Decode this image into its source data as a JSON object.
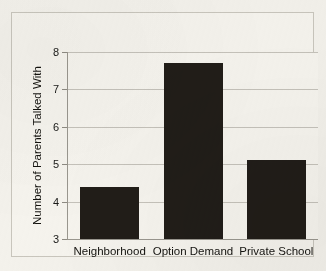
{
  "chart_data": {
    "type": "bar",
    "title": "",
    "xlabel": "",
    "ylabel": "Number of Parents Talked With",
    "categories": [
      "Neighborhood",
      "Option Demand",
      "Private School"
    ],
    "values": [
      4.4,
      7.7,
      5.1
    ],
    "ylim": [
      3,
      8
    ],
    "yticks": [
      3,
      4,
      5,
      6,
      7,
      8
    ],
    "ytick_labels": [
      "3",
      "4",
      "5",
      "6",
      "7",
      "8"
    ],
    "grid": true,
    "legend": false,
    "bar_color": "#211d18",
    "plot_background": "#f7f5ef",
    "gridline_color": "#c6c3bb",
    "axis_color": "#9a978f",
    "page_background": "#f4f2ec"
  }
}
